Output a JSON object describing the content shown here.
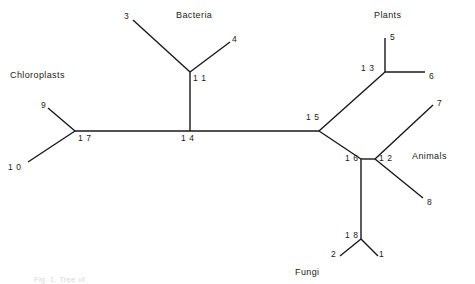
{
  "figure": {
    "kind": "unrooted-phylogenetic-tree",
    "caption": "Fig. 1. Tree of",
    "stroke_color": "#181818",
    "background_color": "#ffffff",
    "text_color": "#1a1a1a"
  },
  "group_labels": [
    {
      "id": "bacteria",
      "text": "Bacteria",
      "x": 176,
      "y": 11
    },
    {
      "id": "plants",
      "text": "Plants",
      "x": 374,
      "y": 11
    },
    {
      "id": "chloroplasts",
      "text": "Chloroplasts",
      "x": 10,
      "y": 71
    },
    {
      "id": "animals",
      "text": "Animals",
      "x": 412,
      "y": 152
    },
    {
      "id": "fungi",
      "text": "Fungi",
      "x": 295,
      "y": 268
    }
  ],
  "leaf_labels": [
    {
      "id": "1",
      "text": "1",
      "x": 379,
      "y": 250
    },
    {
      "id": "2",
      "text": "2",
      "x": 331,
      "y": 250
    },
    {
      "id": "3",
      "text": "3",
      "x": 124,
      "y": 12
    },
    {
      "id": "4",
      "text": "4",
      "x": 232,
      "y": 35
    },
    {
      "id": "5",
      "text": "5",
      "x": 390,
      "y": 33
    },
    {
      "id": "6",
      "text": "6",
      "x": 429,
      "y": 72
    },
    {
      "id": "7",
      "text": "7",
      "x": 437,
      "y": 99
    },
    {
      "id": "8",
      "text": "8",
      "x": 427,
      "y": 198
    },
    {
      "id": "9",
      "text": "9",
      "x": 41,
      "y": 101
    },
    {
      "id": "10",
      "text": "1 0",
      "x": 8,
      "y": 163
    }
  ],
  "node_labels": [
    {
      "id": "11",
      "text": "1 1",
      "x": 193,
      "y": 74
    },
    {
      "id": "12",
      "text": "1 2",
      "x": 379,
      "y": 154
    },
    {
      "id": "13",
      "text": "1 3",
      "x": 361,
      "y": 64
    },
    {
      "id": "14",
      "text": "1 4",
      "x": 181,
      "y": 134
    },
    {
      "id": "15",
      "text": "1 5",
      "x": 306,
      "y": 113
    },
    {
      "id": "16",
      "text": "1 6",
      "x": 345,
      "y": 154
    },
    {
      "id": "17",
      "text": "1 7",
      "x": 78,
      "y": 134
    },
    {
      "id": "18",
      "text": "1 8",
      "x": 345,
      "y": 231
    }
  ],
  "chart_data": {
    "type": "diagram",
    "nodes": [
      {
        "id": "1",
        "type": "leaf",
        "label": "1",
        "x": 378,
        "y": 256,
        "group": "Fungi"
      },
      {
        "id": "2",
        "type": "leaf",
        "label": "2",
        "x": 340,
        "y": 256,
        "group": "Fungi"
      },
      {
        "id": "3",
        "type": "leaf",
        "label": "3",
        "x": 133,
        "y": 20,
        "group": "Bacteria"
      },
      {
        "id": "4",
        "type": "leaf",
        "label": "4",
        "x": 230,
        "y": 42,
        "group": "Bacteria"
      },
      {
        "id": "5",
        "type": "leaf",
        "label": "5",
        "x": 385,
        "y": 38,
        "group": "Plants"
      },
      {
        "id": "6",
        "type": "leaf",
        "label": "6",
        "x": 425,
        "y": 72,
        "group": "Plants"
      },
      {
        "id": "7",
        "type": "leaf",
        "label": "7",
        "x": 433,
        "y": 105,
        "group": "Animals"
      },
      {
        "id": "8",
        "type": "leaf",
        "label": "8",
        "x": 423,
        "y": 198,
        "group": "Animals"
      },
      {
        "id": "9",
        "type": "leaf",
        "label": "9",
        "x": 48,
        "y": 108,
        "group": "Chloroplasts"
      },
      {
        "id": "10",
        "type": "leaf",
        "label": "10",
        "x": 28,
        "y": 162,
        "group": "Chloroplasts"
      },
      {
        "id": "11",
        "type": "internal",
        "label": "11",
        "x": 190,
        "y": 72,
        "group": "Bacteria"
      },
      {
        "id": "12",
        "type": "internal",
        "label": "12",
        "x": 375,
        "y": 159,
        "group": "Animals"
      },
      {
        "id": "13",
        "type": "internal",
        "label": "13",
        "x": 385,
        "y": 72,
        "group": "Plants"
      },
      {
        "id": "14",
        "type": "internal",
        "label": "14",
        "x": 190,
        "y": 131,
        "group": ""
      },
      {
        "id": "15",
        "type": "internal",
        "label": "15",
        "x": 319,
        "y": 131,
        "group": ""
      },
      {
        "id": "16",
        "type": "internal",
        "label": "16",
        "x": 361,
        "y": 159,
        "group": ""
      },
      {
        "id": "17",
        "type": "internal",
        "label": "17",
        "x": 75,
        "y": 131,
        "group": "Chloroplasts"
      },
      {
        "id": "18",
        "type": "internal",
        "label": "18",
        "x": 361,
        "y": 239,
        "group": "Fungi"
      }
    ],
    "edges": [
      {
        "from": "3",
        "to": "11"
      },
      {
        "from": "4",
        "to": "11"
      },
      {
        "from": "11",
        "to": "14"
      },
      {
        "from": "9",
        "to": "17"
      },
      {
        "from": "10",
        "to": "17"
      },
      {
        "from": "17",
        "to": "14"
      },
      {
        "from": "14",
        "to": "15"
      },
      {
        "from": "15",
        "to": "13"
      },
      {
        "from": "13",
        "to": "5"
      },
      {
        "from": "13",
        "to": "6"
      },
      {
        "from": "15",
        "to": "16"
      },
      {
        "from": "16",
        "to": "12"
      },
      {
        "from": "12",
        "to": "7"
      },
      {
        "from": "12",
        "to": "8"
      },
      {
        "from": "16",
        "to": "18"
      },
      {
        "from": "18",
        "to": "2"
      },
      {
        "from": "18",
        "to": "1"
      }
    ]
  }
}
